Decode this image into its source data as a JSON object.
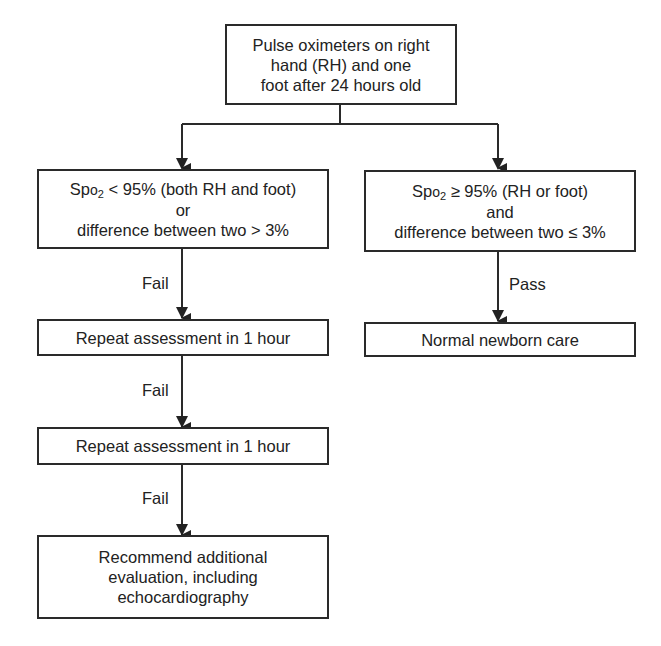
{
  "flowchart": {
    "start": {
      "lines": [
        "Pulse oximeters on right",
        "hand (RH) and one",
        "foot after 24 hours old"
      ]
    },
    "fail_criteria": {
      "line1_prefix": "Sp",
      "line1_sub_o": "o",
      "line1_sub_2": "2",
      "line1_rest": " < 95% (both RH and foot)",
      "line2": "or",
      "line3": "difference between two > 3%"
    },
    "pass_criteria": {
      "line1_prefix": "Sp",
      "line1_sub_o": "o",
      "line1_sub_2": "2",
      "line1_rest": " ≥ 95% (RH or foot)",
      "line2": "and",
      "line3": "difference between two ≤ 3%"
    },
    "repeat1": {
      "text": "Repeat assessment in 1 hour"
    },
    "repeat2": {
      "text": "Repeat assessment in 1 hour"
    },
    "normal_care": {
      "text": "Normal newborn care"
    },
    "recommend": {
      "lines": [
        "Recommend additional",
        "evaluation, including",
        "echocardiography"
      ]
    },
    "edge_labels": {
      "fail1": "Fail",
      "fail2": "Fail",
      "fail3": "Fail",
      "pass": "Pass"
    }
  }
}
